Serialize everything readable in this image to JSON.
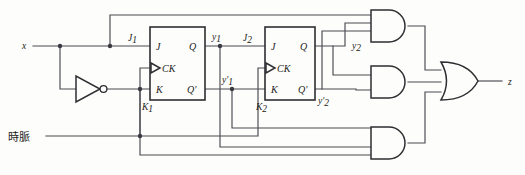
{
  "diagram": {
    "colors": {
      "wire": "#4a4a52",
      "gate_outline": "#2e2e33",
      "background": "#fdfdfb",
      "text": "#1c1c20"
    },
    "inputs": [
      {
        "name": "x",
        "label": "x"
      },
      {
        "name": "clock",
        "label": "時脈"
      }
    ],
    "outputs": [
      {
        "name": "z",
        "label": "z"
      }
    ],
    "flipflops": [
      {
        "id": "ff1",
        "pins": {
          "j": "J",
          "k": "K",
          "ck": "CK",
          "q": "Q",
          "qbar": "Q'"
        },
        "input_labels": {
          "j": "J",
          "j_sub": "1",
          "k": "K",
          "k_sub": "1"
        },
        "output_labels": {
          "q": "y",
          "q_sub": "1",
          "qbar": "y'",
          "qbar_sub": "1"
        }
      },
      {
        "id": "ff2",
        "pins": {
          "j": "J",
          "k": "K",
          "ck": "CK",
          "q": "Q",
          "qbar": "Q'"
        },
        "input_labels": {
          "j": "J",
          "j_sub": "2",
          "k": "K",
          "k_sub": "2"
        },
        "output_labels": {
          "q": "y",
          "q_sub": "2",
          "qbar": "y'",
          "qbar_sub": "2"
        }
      }
    ],
    "gates": [
      {
        "id": "not1",
        "type": "NOT",
        "inputs": 1
      },
      {
        "id": "and1",
        "type": "AND",
        "inputs": 2
      },
      {
        "id": "and2",
        "type": "AND",
        "inputs": 2
      },
      {
        "id": "and3",
        "type": "AND",
        "inputs": 2
      },
      {
        "id": "or1",
        "type": "OR",
        "inputs": 3
      }
    ],
    "signal_labels": [
      {
        "name": "x",
        "base": "x",
        "sub": ""
      },
      {
        "name": "j1",
        "base": "J",
        "sub": "1"
      },
      {
        "name": "k1",
        "base": "K",
        "sub": "1"
      },
      {
        "name": "y1",
        "base": "y",
        "sub": "1"
      },
      {
        "name": "y1bar",
        "base": "y'",
        "sub": "1"
      },
      {
        "name": "j2",
        "base": "J",
        "sub": "2"
      },
      {
        "name": "k2",
        "base": "K",
        "sub": "2"
      },
      {
        "name": "y2",
        "base": "y",
        "sub": "2"
      },
      {
        "name": "y2bar",
        "base": "y'",
        "sub": "2"
      },
      {
        "name": "z",
        "base": "z",
        "sub": ""
      },
      {
        "name": "clock",
        "base": "時脈",
        "sub": ""
      }
    ]
  }
}
